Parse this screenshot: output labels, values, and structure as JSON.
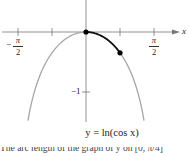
{
  "chart_data": {
    "type": "line",
    "title": "",
    "function_label": "y = ln(cos x)",
    "xlabel": "x",
    "ylabel": "y",
    "x_ticks": [
      {
        "value": -1.5708,
        "label": "-π/2"
      },
      {
        "value": -0.7854,
        "label": ""
      },
      {
        "value": 0,
        "label": ""
      },
      {
        "value": 0.7854,
        "label": ""
      },
      {
        "value": 1.5708,
        "label": "π/2"
      }
    ],
    "y_ticks": [
      {
        "value": -1,
        "label": "-1"
      }
    ],
    "xlim": [
      -1.95,
      1.95
    ],
    "ylim": [
      -1.5,
      0.55
    ],
    "grid": false,
    "series": [
      {
        "name": "y = ln(cos x)",
        "color": "#a6a6a6",
        "domain": [
          -1.34,
          1.34
        ],
        "x": [
          -1.34,
          -1.2,
          -1.0,
          -0.8,
          -0.6,
          -0.4,
          -0.2,
          0,
          0.2,
          0.4,
          0.6,
          0.8,
          1.0,
          1.2,
          1.34
        ],
        "y": [
          -1.48,
          -1.01,
          -0.62,
          -0.36,
          -0.19,
          -0.08,
          -0.02,
          0,
          -0.02,
          -0.08,
          -0.19,
          -0.36,
          -0.62,
          -1.01,
          -1.48
        ]
      },
      {
        "name": "arc segment on [0, π/4]",
        "color": "#111111",
        "domain": [
          0,
          0.7854
        ],
        "x": [
          0,
          0.2,
          0.4,
          0.6,
          0.7854
        ],
        "y": [
          0,
          -0.02,
          -0.08,
          -0.19,
          -0.3466
        ]
      }
    ],
    "points": [
      {
        "x": 0,
        "y": 0
      },
      {
        "x": 0.7854,
        "y": -0.3466
      }
    ]
  },
  "labels": {
    "neg_pi_num": "π",
    "neg_pi_den": "2",
    "neg_sign": "−",
    "pi_num": "π",
    "pi_den": "2",
    "x_axis": "x",
    "y_minus_one": "−1",
    "equation": "y = ln(cos x)",
    "caption": "The arc length of the graph of y on  [0, π/4]"
  }
}
